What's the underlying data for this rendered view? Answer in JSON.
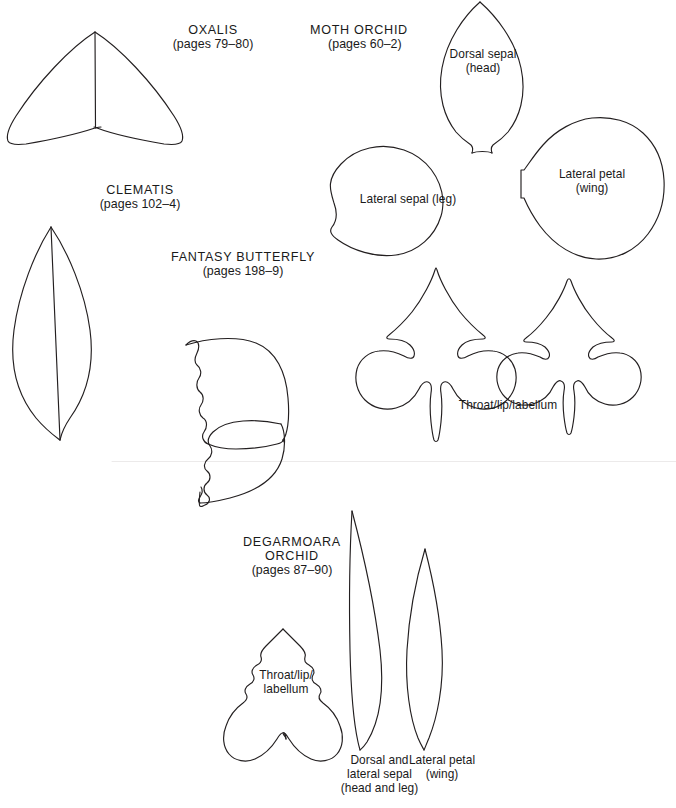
{
  "page": {
    "kind": "craft-template-sheet",
    "background_color": "#ffffff",
    "ink_color": "#231f20",
    "width": 676,
    "height": 808
  },
  "templates": [
    {
      "id": "oxalis",
      "heading": "OXALIS",
      "pages": "(pages 79–80)",
      "parts": []
    },
    {
      "id": "clematis",
      "heading": "CLEMATIS",
      "pages": "(pages 102–4)",
      "parts": []
    },
    {
      "id": "fantasy-butterfly",
      "heading": "FANTASY BUTTERFLY",
      "pages": "(pages 198–9)",
      "parts": []
    },
    {
      "id": "moth-orchid",
      "heading": "MOTH ORCHID",
      "pages": "(pages 60–2)",
      "parts": [
        {
          "id": "dorsal-sepal",
          "line1": "Dorsal sepal",
          "line2": "(head)"
        },
        {
          "id": "lateral-sepal",
          "line1": "Lateral sepal (leg)",
          "line2": ""
        },
        {
          "id": "lateral-petal",
          "line1": "Lateral petal",
          "line2": "(wing)"
        },
        {
          "id": "throat-lip-labellum",
          "line1": "Throat/lip/labellum",
          "line2": ""
        }
      ]
    },
    {
      "id": "degarmoara-orchid",
      "heading_line1": "DEGARMOARA",
      "heading_line2": "ORCHID",
      "pages": "(pages 87–90)",
      "parts": [
        {
          "id": "throat-lip-labellum",
          "line1": "Throat/lip/",
          "line2": "labellum"
        },
        {
          "id": "dorsal-and-lateral-sepal",
          "line1": "Dorsal and",
          "line2": "lateral sepal",
          "line3": "(head and leg)"
        },
        {
          "id": "lateral-petal",
          "line1": "Lateral petal",
          "line2": "(wing)"
        }
      ]
    }
  ],
  "labels": {
    "oxalis_heading": "OXALIS",
    "oxalis_pages": "(pages 79–80)",
    "clematis_heading": "CLEMATIS",
    "clematis_pages": "(pages 102–4)",
    "butterfly_heading": "FANTASY BUTTERFLY",
    "butterfly_pages": "(pages 198–9)",
    "moth_heading": "MOTH ORCHID",
    "moth_pages": "(pages 60–2)",
    "moth_dorsal_1": "Dorsal sepal",
    "moth_dorsal_2": "(head)",
    "moth_lateral_sepal": "Lateral sepal (leg)",
    "moth_lateral_petal_1": "Lateral petal",
    "moth_lateral_petal_2": "(wing)",
    "moth_throat": "Throat/lip/labellum",
    "deg_heading_1": "DEGARMOARA",
    "deg_heading_2": "ORCHID",
    "deg_pages": "(pages 87–90)",
    "deg_throat_1": "Throat/lip/",
    "deg_throat_2": "labellum",
    "deg_sepal_1": "Dorsal and",
    "deg_sepal_2": "lateral sepal",
    "deg_sepal_3": "(head and leg)",
    "deg_petal_1": "Lateral petal",
    "deg_petal_2": "(wing)"
  }
}
